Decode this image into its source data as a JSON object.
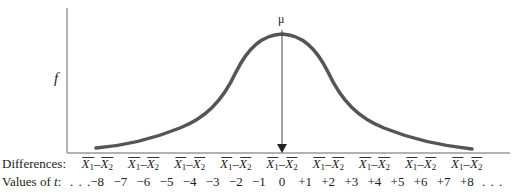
{
  "chart_data": {
    "type": "line",
    "title": "",
    "ylabel": "f",
    "xlabel_rows": [
      "Differences:",
      "Values of t:"
    ],
    "peak_label": "μ",
    "x": [
      -8,
      -7,
      -6,
      -5,
      -4,
      -3,
      -2,
      -1,
      0,
      1,
      2,
      3,
      4,
      5,
      6,
      7,
      8
    ],
    "t_tick_labels": [
      "−8",
      "−7",
      "−6",
      "−5",
      "−4",
      "−3",
      "−2",
      "−1",
      "0",
      "+1",
      "+2",
      "+3",
      "+4",
      "+5",
      "+6",
      "+7",
      "+8"
    ],
    "difference_tick_label": "X̄1 − X̄2",
    "difference_tick_positions_t": [
      -8,
      -6,
      -4,
      -2,
      0,
      2,
      4,
      6,
      8
    ],
    "leading_ellipsis": "...",
    "trailing_ellipsis": "...",
    "curve": "symmetric bell-shaped, peak at t = 0 (μ), approaching axis near t = ±8",
    "grid": false,
    "legend": null
  },
  "labels": {
    "y_axis": "f",
    "mu": "μ",
    "differences_row": "Differences:",
    "values_row_prefix": "Values of ",
    "values_row_var": "t",
    "values_row_suffix": ":",
    "ellipsis": ". . .",
    "diff_x": "X",
    "diff_sub1": "1",
    "diff_minus": "–",
    "diff_sub2": "2"
  },
  "colors": {
    "curve": "#555555",
    "axis": "#888888",
    "arrow": "#333333",
    "text": "#222222"
  }
}
